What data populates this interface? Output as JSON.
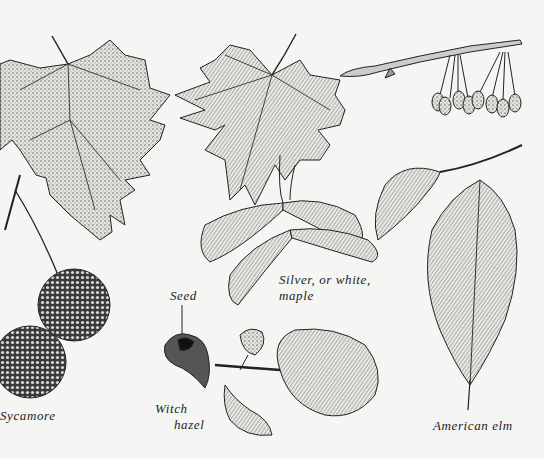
{
  "illustration": {
    "subject": "Tree leaves, seeds and fruits",
    "style": "black-and-white pen-and-ink botanical drawing",
    "background_color": "#f5f5f3",
    "ink_color": "#1c1c1c"
  },
  "labels": {
    "sycamore": "Sycamore",
    "silver_maple_line1": "Silver, or white,",
    "silver_maple_line2": "maple",
    "seed": "Seed",
    "witch_hazel_line1": "Witch",
    "witch_hazel_line2": "hazel",
    "american_elm": "American elm"
  },
  "specimens": [
    {
      "name": "Sycamore",
      "parts": [
        "leaf",
        "seed balls"
      ]
    },
    {
      "name": "Silver, or white, maple",
      "parts": [
        "leaf",
        "winged samaras"
      ]
    },
    {
      "name": "American elm",
      "parts": [
        "twig with fruits",
        "leaves"
      ]
    },
    {
      "name": "Witch hazel",
      "parts": [
        "seed capsule",
        "flower",
        "leaf"
      ]
    }
  ]
}
